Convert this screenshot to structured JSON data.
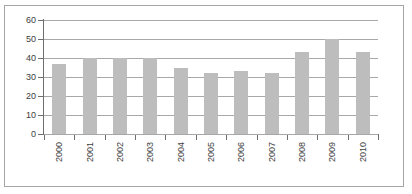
{
  "chart_data": {
    "type": "bar",
    "title": "",
    "subtitle": "",
    "xlabel": "",
    "ylabel": "",
    "categories": [
      "2000",
      "2001",
      "2002",
      "2003",
      "2004",
      "2005",
      "2006",
      "2007",
      "2008",
      "2009",
      "2010"
    ],
    "values": [
      37,
      40,
      40,
      40,
      35,
      32,
      33,
      32,
      43,
      50,
      43
    ],
    "series": [
      {
        "name": "",
        "values": [
          37,
          40,
          40,
          40,
          35,
          32,
          33,
          32,
          43,
          50,
          43
        ]
      }
    ],
    "ylim": [
      0,
      60
    ],
    "yticks": [
      0,
      10,
      20,
      30,
      40,
      50,
      60
    ],
    "ytick_labels": [
      "0",
      "10",
      "20",
      "30",
      "40",
      "50",
      "60"
    ],
    "xtick_labels": [
      "2000",
      "2001",
      "2002",
      "2003",
      "2004",
      "2005",
      "2006",
      "2007",
      "2008",
      "2009",
      "2010"
    ],
    "xtick_label_rotation": 90,
    "grid": true,
    "grid_axis": "y",
    "legend": false,
    "legend_position": "none",
    "bar_color": "#bdbdbd",
    "grid_color": "#a8a8a8",
    "axis_color": "#6e6e6e",
    "frame_color": "#a6a6a6",
    "background_color": "#ffffff"
  }
}
